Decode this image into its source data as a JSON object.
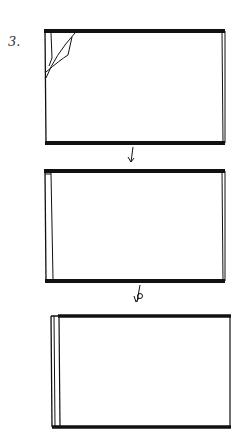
{
  "step": {
    "label": "3."
  },
  "colors": {
    "ink": "#111111",
    "paper": "#ffffff"
  },
  "panels": [
    {
      "id": "panel-1",
      "description": "rectangle with top-left corner peeling/folding"
    },
    {
      "id": "panel-2",
      "description": "rectangle with narrow strip along left edge"
    },
    {
      "id": "panel-3",
      "description": "rectangle with wider strip on left edge, shifted right"
    }
  ],
  "arrows": [
    {
      "id": "arrow-1",
      "label": ""
    },
    {
      "id": "arrow-2",
      "label": "b"
    }
  ]
}
